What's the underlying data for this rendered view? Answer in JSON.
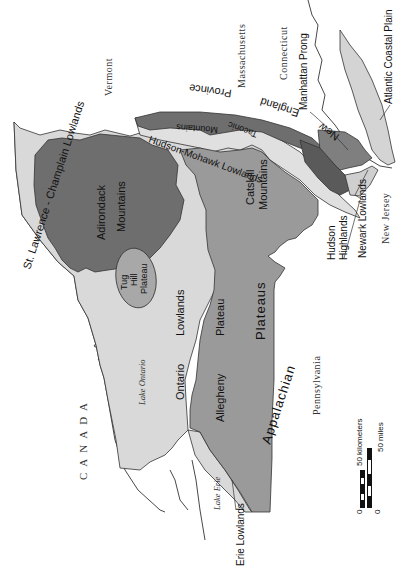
{
  "map": {
    "title": "",
    "orientation": "rotated 90 degrees clockwise",
    "colors": {
      "background": "#ffffff",
      "lowlands": "#d9d9d9",
      "plateaus": "#9a9a9a",
      "mountains_dark": "#6e6e6e",
      "new_england_province": "#7f7f7f",
      "coastal_plain": "#d4d4d4",
      "outline": "#333333"
    },
    "regions": {
      "st_lawrence": "St. Lawrence - Champlain Lowlands",
      "adirondack": [
        "Adirondack",
        "Mountains"
      ],
      "tug_hill": [
        "Tug",
        "Hill",
        "Plateau"
      ],
      "ontario_lowlands": [
        "Ontario",
        "Lowlands"
      ],
      "allegheny_plateau": [
        "Allegheny",
        "Plateau"
      ],
      "appalachian_plateaus": [
        "Appalachian",
        "Plateaus"
      ],
      "catskill": [
        "Catskill",
        "Mountains"
      ],
      "hudson_mohawk": "Hudson-Mohawk Lowlands",
      "taconic": [
        "Taconic",
        "Mountains"
      ],
      "new_england": [
        "New",
        "England",
        "Province"
      ],
      "hudson_highlands": [
        "Hudson",
        "Highlands"
      ],
      "newark_lowlands": "Newark Lowlands",
      "manhattan_prong": "Manhattan Prong",
      "atlantic_coastal_plain": "Atlantic Coastal Plain",
      "erie_lowlands": "Erie Lowlands"
    },
    "states": {
      "vermont": "Vermont",
      "massachusetts": "Massachusetts",
      "connecticut": "Connecticut",
      "new_jersey": "New Jersey",
      "pennsylvania": "Pennsylvania",
      "canada": "CANADA"
    },
    "water": {
      "lake_ontario": "Lake Ontario",
      "lake_erie": "Lake Erie"
    },
    "scale_bar": {
      "km_zero": "0",
      "km_label": "50 kilometers",
      "mi_zero": "0",
      "mi_label": "50 miles"
    }
  }
}
